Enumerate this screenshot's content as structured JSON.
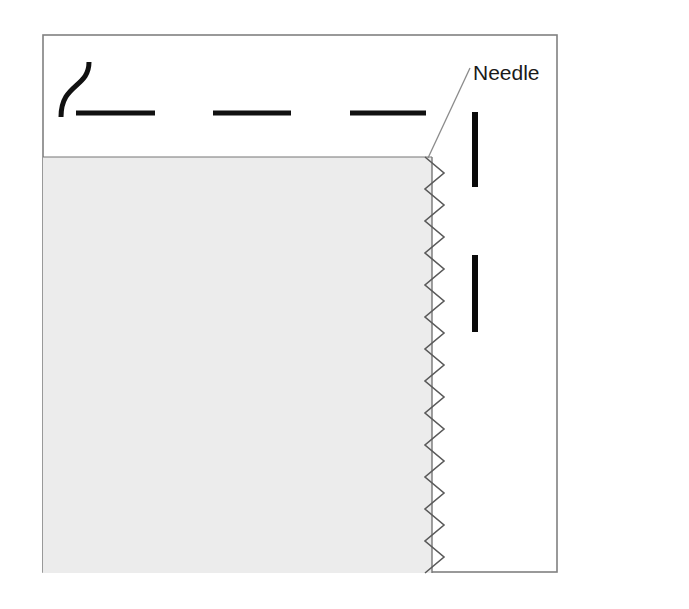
{
  "figure": {
    "kind": "sewing-zigzag-stitch-diagram",
    "background_color": "#ffffff",
    "frame": {
      "name": "diagram-border",
      "x": 42,
      "y": 34,
      "width": 516,
      "height": 539,
      "stroke_color": "#808080",
      "stroke_width": 2,
      "fill": "#ffffff"
    },
    "fabric": {
      "name": "fabric-panel",
      "label": "fabric",
      "x": 43,
      "y": 157,
      "width": 389,
      "height": 416,
      "fill_color": "#ececec",
      "edge_line_color": "#777777",
      "top_edge_y": 157,
      "right_edge_x": 432
    },
    "stitch": {
      "name": "zigzag-stitch",
      "label": "zigzag stitch line",
      "color": "#5a5a5a",
      "stroke_width": 1.6,
      "left_x": 425,
      "right_x": 444,
      "top_y": 157,
      "bottom_y": 573,
      "cycles": 13,
      "period_px": 32
    },
    "thread": {
      "name": "thread-curve",
      "label": "thread S-curve",
      "color": "#111111",
      "stroke_width": 5,
      "start_x": 89,
      "start_y": 62,
      "end_x": 61,
      "end_y": 117
    },
    "dashes": {
      "name": "stitch-dash-marks",
      "label": "straight stitch dashes",
      "color": "#111111",
      "thickness": 5,
      "y": 113,
      "segments": [
        {
          "x1": 76,
          "x2": 155
        },
        {
          "x1": 213,
          "x2": 291
        },
        {
          "x1": 350,
          "x2": 426
        }
      ]
    },
    "needle_bars": {
      "name": "needle-bars",
      "label": "needle",
      "color": "#0a0a0a",
      "width": 6,
      "bars": [
        {
          "x": 472,
          "y1": 112,
          "y2": 187
        },
        {
          "x": 472,
          "y1": 255,
          "y2": 332
        }
      ]
    },
    "callout": {
      "name": "needle-callout",
      "text": "Needle",
      "text_x": 473,
      "text_y": 80,
      "font_size": 21,
      "text_color": "#1a1a1a",
      "leader": {
        "name": "needle-leader-line",
        "color": "#8a8a8a",
        "stroke_width": 1.3,
        "x1": 470,
        "y1": 68,
        "x2": 428,
        "y2": 158
      }
    }
  }
}
